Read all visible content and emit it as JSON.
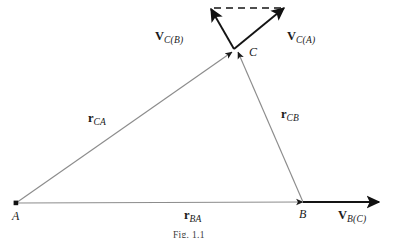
{
  "figure": {
    "caption": "Fig. 1.1",
    "background_color": "#ffffff",
    "ink_color": "#1a1a1a",
    "thin_line_color": "#8c8c8c"
  },
  "points": [
    {
      "id": "A",
      "label": "A",
      "x": 16,
      "y": 203
    },
    {
      "id": "B",
      "label": "B",
      "x": 303,
      "y": 202
    },
    {
      "id": "C",
      "label": "C",
      "x": 236,
      "y": 53
    }
  ],
  "position_vectors": [
    {
      "name": "r_CA",
      "symbol": "r",
      "subscript": "CA",
      "from": "A",
      "to": "C",
      "label_x": 88,
      "label_y": 112
    },
    {
      "name": "r_CB",
      "symbol": "r",
      "subscript": "CB",
      "from": "B",
      "to": "C",
      "label_x": 281,
      "label_y": 108
    },
    {
      "name": "r_BA",
      "symbol": "r",
      "subscript": "BA",
      "from": "A",
      "to": "B",
      "label_x": 184,
      "label_y": 212
    }
  ],
  "velocity_vectors": [
    {
      "name": "V_C(B)",
      "symbol": "V",
      "subscript": "C(B)",
      "tail_x": 234,
      "tail_y": 49,
      "tip_x": 211,
      "tip_y": 9,
      "label_x": 158,
      "label_y": 32
    },
    {
      "name": "V_C(A)",
      "symbol": "V",
      "subscript": "C(A)",
      "tail_x": 234,
      "tail_y": 49,
      "tip_x": 284,
      "tip_y": 8,
      "label_x": 287,
      "label_y": 32
    },
    {
      "name": "V_B(C)",
      "symbol": "V",
      "subscript": "B(C)",
      "tail_x": 303,
      "tail_y": 202,
      "tip_x": 379,
      "tip_y": 202,
      "label_x": 338,
      "label_y": 212
    }
  ],
  "dashed_connector": {
    "name": "velocity-closure-dash",
    "from_x": 214,
    "from_y": 8,
    "to_x": 281,
    "to_y": 8
  }
}
